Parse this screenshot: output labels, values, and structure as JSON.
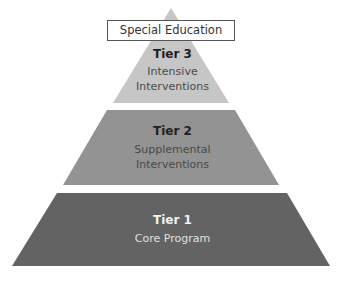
{
  "header_box": {
    "label": "Special Education"
  },
  "tiers": [
    {
      "title": "Tier 3",
      "lines": [
        "Intensive",
        "Interventions"
      ],
      "color": "#c6c6c6",
      "text_color": "#4a4a4a"
    },
    {
      "title": "Tier 2",
      "lines": [
        "Supplemental",
        "Interventions"
      ],
      "color": "#939393",
      "text_color": "#4a4a4a"
    },
    {
      "title": "Tier 1",
      "lines": [
        "Core Program"
      ],
      "color": "#636363",
      "text_color": "#e0e0e0"
    }
  ]
}
